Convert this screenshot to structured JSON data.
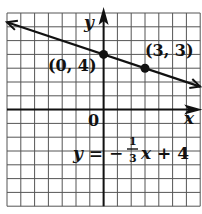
{
  "chart_data": {
    "type": "line",
    "title": "",
    "xlabel": "x",
    "ylabel": "y",
    "xlim": [
      -7,
      7
    ],
    "ylim": [
      -7,
      7
    ],
    "grid": true,
    "origin_label": "0",
    "equation": {
      "lhs": "y = −",
      "frac_num": "1",
      "frac_den": "3",
      "rhs": "x + 4"
    },
    "series": [
      {
        "name": "y = -1/3 x + 4",
        "slope": -0.3333,
        "intercept": 4,
        "x": [
          -7,
          7
        ],
        "y": [
          6.333,
          1.667
        ]
      }
    ],
    "points": [
      {
        "x": 0,
        "y": 4,
        "label": "(0, 4)"
      },
      {
        "x": 3,
        "y": 3,
        "label": "(3, 3)"
      }
    ],
    "colors": {
      "line": "#111111",
      "grid": "#555555",
      "background": "#ffffff"
    }
  }
}
